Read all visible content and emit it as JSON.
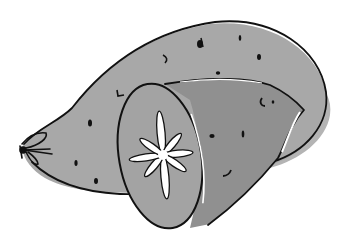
{
  "illustration": {
    "subject": "sweet potato, whole with cut half",
    "colors": {
      "background": "#ffffff",
      "skin": "#a8a8a8",
      "cut_side": "#909090",
      "cut_face": "#a3a3a3",
      "outline": "#111111",
      "highlight": "#ffffff",
      "shadow": "#9a9a9a"
    }
  }
}
